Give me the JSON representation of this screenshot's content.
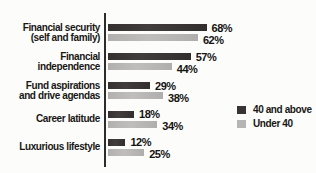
{
  "chart_data": {
    "type": "bar",
    "orientation": "horizontal",
    "title": "",
    "xlabel": "",
    "ylabel": "",
    "value_suffix": "%",
    "xlim": [
      0,
      100
    ],
    "grid": false,
    "legend_position": "right",
    "categories": [
      "Financial security (self and family)",
      "Financial independence",
      "Fund aspirations and drive agendas",
      "Career latitude",
      "Luxurious lifestyle"
    ],
    "category_lines": [
      [
        "Financial security",
        "(self and family)"
      ],
      [
        "Financial independence"
      ],
      [
        "Fund aspirations",
        "and drive agendas"
      ],
      [
        "Career latitude"
      ],
      [
        "Luxurious lifestyle"
      ]
    ],
    "series": [
      {
        "name": "40 and above",
        "color": "#383433",
        "values": [
          68,
          57,
          29,
          18,
          12
        ]
      },
      {
        "name": "Under 40",
        "color": "#b7b5b4",
        "values": [
          62,
          44,
          38,
          34,
          25
        ]
      }
    ]
  },
  "colors": {
    "axis": "#2e2c2b",
    "text": "#191715",
    "background": "#fcfcfb"
  }
}
